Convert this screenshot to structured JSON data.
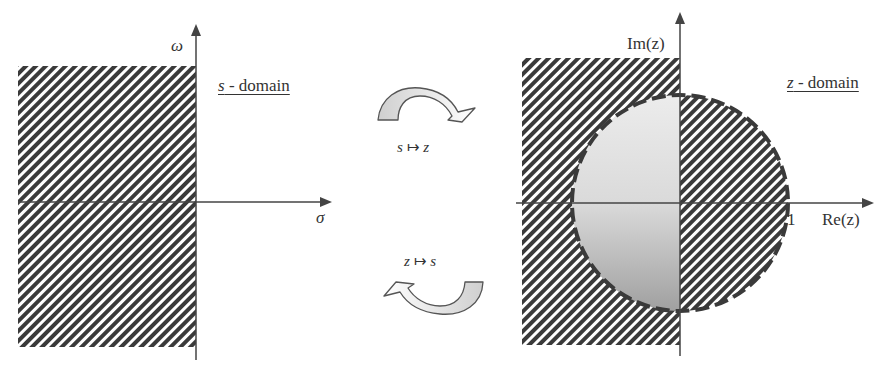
{
  "s_domain": {
    "title_var": "s",
    "title_rest": " - domain",
    "vertical_axis_label": "ω",
    "horizontal_axis_label": "σ",
    "shaded_region": "left half-plane (Re(s) < 0)"
  },
  "z_domain": {
    "title_var": "z",
    "title_rest": " - domain",
    "vertical_axis_label": "Im(z)",
    "horizontal_axis_label": "Re(z)",
    "unit_tick_label": "1",
    "unit_circle": "dashed boundary, radius 1"
  },
  "mappings": {
    "forward": {
      "from": "s",
      "arrow": "↦",
      "to": "z"
    },
    "inverse": {
      "from": "z",
      "arrow": "↦",
      "to": "s"
    }
  },
  "colors": {
    "hatch_dark": "#3a3a3a",
    "hatch_light": "#ffffff",
    "circle_fill_top": "#e2e2e2",
    "circle_fill_bottom": "#a9a9a9",
    "axis": "#444444",
    "arrow_fill": "#d6d6d6"
  }
}
